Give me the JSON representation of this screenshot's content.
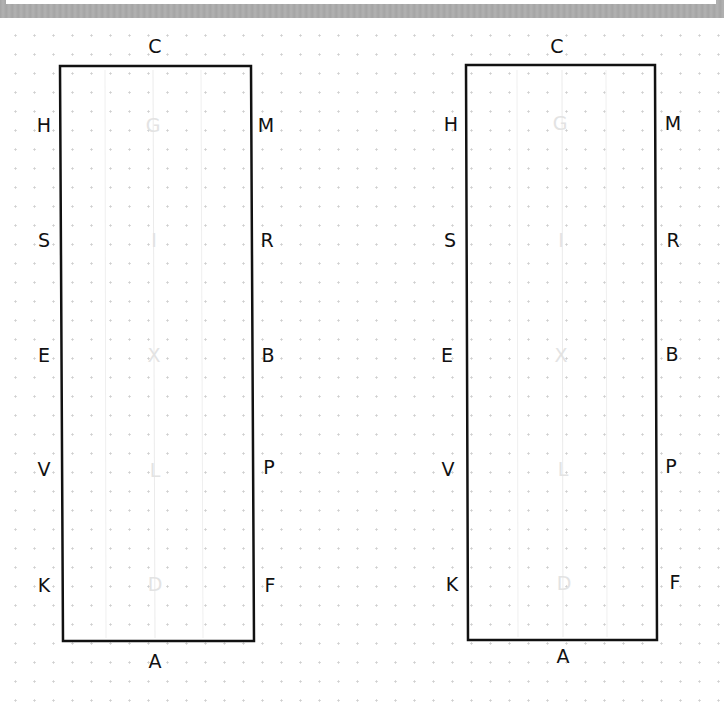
{
  "colors": {
    "border": "#111111",
    "center_letter": "#e3e3e3",
    "guide_line": "#eeeeee",
    "dot": "#cfcfcf",
    "top_frame": "#a9a9a9"
  },
  "arenas": [
    {
      "name": "left",
      "letters": {
        "top": "C",
        "bottom": "A",
        "left": [
          "H",
          "S",
          "E",
          "V",
          "K"
        ],
        "right": [
          "M",
          "R",
          "B",
          "P",
          "F"
        ],
        "center": [
          "G",
          "I",
          "X",
          "L",
          "D"
        ]
      }
    },
    {
      "name": "right",
      "letters": {
        "top": "C",
        "bottom": "A",
        "left": [
          "H",
          "S",
          "E",
          "V",
          "K"
        ],
        "right": [
          "M",
          "R",
          "B",
          "P",
          "F"
        ],
        "center": [
          "G",
          "I",
          "X",
          "L",
          "D"
        ]
      }
    }
  ]
}
